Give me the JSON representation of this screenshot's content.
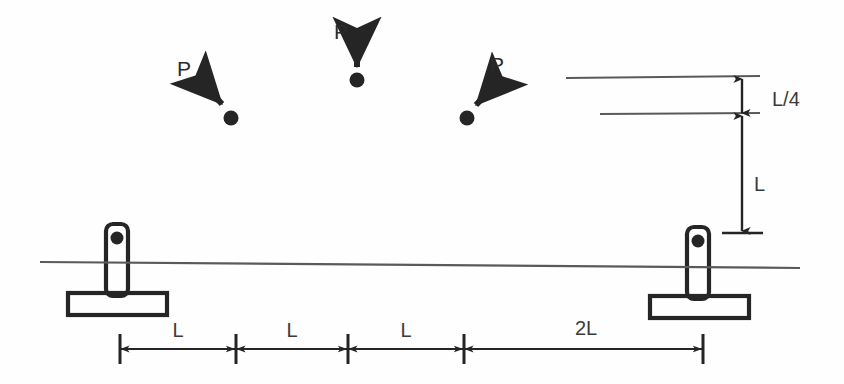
{
  "diagram": {
    "background_color": "#fefefe",
    "ink_color": "#252525",
    "thin_line_color": "#5a5a5a",
    "loads": [
      {
        "id": "load-left",
        "label": "P",
        "direction": "down-right",
        "label_x": 184,
        "label_y": 70,
        "tail_x": 196,
        "tail_y": 76,
        "head_x": 226,
        "head_y": 108,
        "dot_x": 231,
        "dot_y": 118
      },
      {
        "id": "load-middle",
        "label": "P",
        "direction": "down",
        "label_x": 341,
        "label_y": 33,
        "tail_x": 357,
        "tail_y": 36,
        "head_x": 357,
        "head_y": 71,
        "dot_x": 357,
        "dot_y": 80
      },
      {
        "id": "load-right",
        "label": "P",
        "direction": "down-left",
        "label_x": 497,
        "label_y": 66,
        "tail_x": 497,
        "tail_y": 80,
        "head_x": 472,
        "head_y": 109,
        "dot_x": 467,
        "dot_y": 118
      }
    ],
    "supports": [
      {
        "id": "support-left",
        "x": 117,
        "pin_y": 238,
        "base_y": 295
      },
      {
        "id": "support-right",
        "x": 698,
        "pin_y": 240,
        "base_y": 298
      }
    ],
    "beam_line": {
      "x1": 40,
      "y1": 262,
      "x2": 800,
      "y2": 268
    },
    "reference_lines": [
      {
        "id": "upper-reference-line",
        "x1": 566,
        "y1": 78,
        "x2": 760,
        "y2": 76
      },
      {
        "id": "lower-reference-line",
        "x1": 600,
        "y1": 114,
        "x2": 760,
        "y2": 113
      }
    ],
    "vertical_dimensions": [
      {
        "id": "dim-l-over-4",
        "label": "L/4",
        "x": 742,
        "y_top": 78,
        "y_bottom": 114,
        "label_x": 774,
        "label_y": 101
      },
      {
        "id": "dim-l",
        "label": "L",
        "x": 742,
        "y_top": 114,
        "y_bottom": 233,
        "label_x": 758,
        "label_y": 186
      }
    ],
    "horizontal_dimensions": {
      "baseline_y": 349,
      "tick_top": 334,
      "tick_bottom": 364,
      "segments": [
        {
          "id": "dim-seg-1",
          "label": "L",
          "x_start": 120,
          "x_end": 236,
          "label_x": 178,
          "label_y": 332
        },
        {
          "id": "dim-seg-2",
          "label": "L",
          "x_start": 236,
          "x_end": 348,
          "label_x": 292,
          "label_y": 332
        },
        {
          "id": "dim-seg-3",
          "label": "L",
          "x_start": 348,
          "x_end": 464,
          "label_x": 406,
          "label_y": 332
        },
        {
          "id": "dim-seg-4",
          "label": "2L",
          "x_start": 464,
          "x_end": 703,
          "label_x": 586,
          "label_y": 330
        }
      ]
    }
  }
}
